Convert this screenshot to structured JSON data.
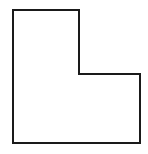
{
  "diagram": {
    "shape": "L-shaped polygon",
    "points": [
      [
        13,
        10
      ],
      [
        79,
        10
      ],
      [
        79,
        74
      ],
      [
        140,
        74
      ],
      [
        140,
        143
      ],
      [
        13,
        143
      ]
    ],
    "stroke_color": "#1a1a1a",
    "stroke_width": 2,
    "fill_color": "#ffffff",
    "background": "#ffffff"
  }
}
